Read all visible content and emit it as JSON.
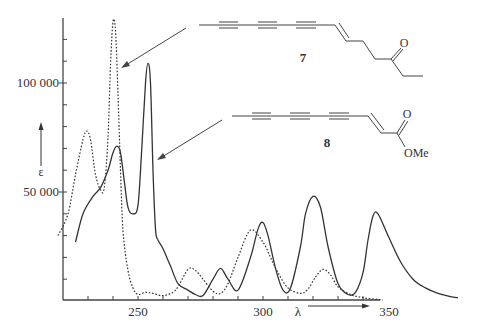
{
  "chart_data": {
    "type": "line",
    "title": "",
    "xlabel": "λ",
    "ylabel": "ε",
    "xlim": [
      218,
      380
    ],
    "ylim": [
      0,
      135000
    ],
    "x_ticks": [
      250,
      300,
      350
    ],
    "x_tick_labels": [
      "250",
      "300",
      "350"
    ],
    "x_minor_step": 10,
    "y_ticks": [
      50000,
      100000
    ],
    "y_tick_labels": [
      "50 000",
      "100 000"
    ],
    "y_minor_step": 10000,
    "grid": false,
    "legend": "structure annotations with arrows",
    "series": [
      {
        "name": "7",
        "style": "dotted",
        "x": [
          218,
          222,
          225,
          228,
          229.5,
          231,
          233,
          235,
          236.5,
          238,
          239,
          240,
          241,
          242,
          243,
          244,
          246,
          248,
          250,
          253,
          256,
          260,
          265,
          270,
          273,
          276,
          280,
          283,
          286,
          290,
          295,
          300,
          303,
          306,
          310,
          315,
          318,
          321,
          324,
          327,
          330,
          335,
          340,
          345,
          348
        ],
        "values": [
          30000,
          40000,
          58000,
          74000,
          78000,
          74000,
          58000,
          51000,
          52000,
          75000,
          108000,
          128000,
          124000,
          95000,
          60000,
          32000,
          14000,
          6000,
          3000,
          4000,
          3500,
          2500,
          5000,
          14500,
          14000,
          10000,
          4500,
          3500,
          8000,
          20000,
          32500,
          27000,
          20000,
          13000,
          6000,
          3500,
          5500,
          11000,
          14500,
          12000,
          6500,
          3000,
          1500,
          800,
          500
        ]
      },
      {
        "name": "8",
        "style": "solid",
        "x": [
          225,
          228,
          232,
          235,
          238,
          240,
          241.5,
          243,
          244.5,
          246,
          248,
          250,
          251.5,
          253,
          254,
          255,
          256,
          257,
          258,
          260,
          263,
          266,
          270,
          273,
          276,
          280,
          283,
          286,
          290,
          295,
          298,
          300,
          302,
          305,
          308,
          311,
          315,
          317,
          320,
          323,
          326,
          330,
          334,
          337,
          340,
          342,
          344,
          346,
          350,
          355,
          360,
          365,
          370,
          375,
          378
        ],
        "values": [
          27000,
          40000,
          48000,
          52000,
          60000,
          68000,
          71000,
          68000,
          55000,
          43000,
          40000,
          44000,
          70000,
          100000,
          109000,
          100000,
          60000,
          33000,
          28000,
          24000,
          16000,
          8000,
          5000,
          3000,
          2500,
          10000,
          15000,
          10000,
          5000,
          20000,
          33000,
          36000,
          30000,
          15000,
          5000,
          6000,
          25000,
          40000,
          48000,
          43000,
          25000,
          8000,
          3000,
          4000,
          13000,
          28000,
          39000,
          40000,
          30000,
          18000,
          10000,
          6000,
          3500,
          2000,
          1500
        ]
      }
    ],
    "annotations": [
      {
        "label": "7",
        "description": "polyyne ketone (triyne-ene with ethyl ketone)",
        "arrow_target_series": "7"
      },
      {
        "label": "8",
        "description": "polyyne methyl ester (triyne-enoate)",
        "arrow_target_series": "8",
        "substituent_text": "OMe",
        "carbonyl_text": "O"
      }
    ]
  },
  "axes": {
    "x_arrow_label": "λ",
    "y_arrow_label": "ε",
    "tick_250": "250",
    "tick_300": "300",
    "tick_350": "350",
    "tick_50000": "50 000",
    "tick_100000": "100 000"
  },
  "structures": {
    "s7": {
      "number": "7",
      "carbonyl_O": "O"
    },
    "s8": {
      "number": "8",
      "carbonyl_O": "O",
      "ester": "OMe"
    }
  }
}
